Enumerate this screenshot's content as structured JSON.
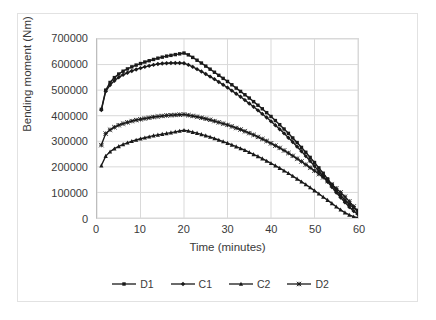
{
  "chart_data": {
    "type": "line",
    "title": "",
    "xlabel": "Time (minutes)",
    "ylabel": "Bending moment (Nm)",
    "xlim": [
      0,
      60
    ],
    "ylim": [
      0,
      700000
    ],
    "xticks": [
      0,
      10,
      20,
      30,
      40,
      50,
      60
    ],
    "yticks": [
      0,
      100000,
      200000,
      300000,
      400000,
      500000,
      600000,
      700000
    ],
    "ytick_labels": [
      "0",
      "100000",
      "200000",
      "300000",
      "400000",
      "500000",
      "600000",
      "700000"
    ],
    "xtick_labels": [
      "0",
      "10",
      "20",
      "30",
      "40",
      "50",
      "60"
    ],
    "grid": "horizontal-and-vertical",
    "legend_position": "bottom",
    "line_color": "#1a1a1a",
    "grid_color": "#d9d9d9",
    "x": [
      1,
      2,
      3,
      4,
      5,
      6,
      7,
      8,
      9,
      10,
      11,
      12,
      13,
      14,
      15,
      16,
      17,
      18,
      19,
      20,
      21,
      22,
      23,
      24,
      25,
      26,
      27,
      28,
      29,
      30,
      31,
      32,
      33,
      34,
      35,
      36,
      37,
      38,
      39,
      40,
      41,
      42,
      43,
      44,
      45,
      46,
      47,
      48,
      49,
      50,
      51,
      52,
      53,
      54,
      55,
      56,
      57,
      58,
      59,
      60
    ],
    "series": [
      {
        "name": "D1",
        "marker": "square",
        "values": [
          425000,
          500000,
          530000,
          549000,
          563000,
          574000,
          583000,
          591000,
          598000,
          604000,
          610000,
          615000,
          620000,
          625000,
          629000,
          633000,
          636000,
          639000,
          642000,
          645000,
          638000,
          628000,
          617000,
          606000,
          594000,
          582000,
          570000,
          558000,
          546000,
          534000,
          521000,
          508000,
          495000,
          482000,
          469000,
          455000,
          441000,
          427000,
          412000,
          397000,
          381000,
          365000,
          348000,
          331000,
          313000,
          295000,
          276000,
          257000,
          237000,
          217000,
          196000,
          175000,
          153000,
          131000,
          109000,
          88000,
          70000,
          54000,
          40000,
          30000
        ]
      },
      {
        "name": "C1",
        "marker": "diamond",
        "values": [
          422000,
          495000,
          520000,
          537000,
          550000,
          560000,
          568000,
          575000,
          581000,
          586000,
          591000,
          595000,
          599000,
          602000,
          604000,
          605000,
          606000,
          606000,
          606000,
          605000,
          599000,
          591000,
          582000,
          573000,
          563000,
          553000,
          543000,
          532000,
          521000,
          510000,
          498000,
          486000,
          474000,
          461000,
          448000,
          435000,
          421000,
          407000,
          393000,
          378000,
          363000,
          347000,
          331000,
          314000,
          297000,
          279000,
          261000,
          242000,
          223000,
          203000,
          183000,
          163000,
          142000,
          121000,
          100000,
          80000,
          61000,
          43000,
          27000,
          14000
        ]
      },
      {
        "name": "C2",
        "marker": "triangle",
        "values": [
          205000,
          242000,
          259000,
          271000,
          280000,
          288000,
          294000,
          300000,
          305000,
          310000,
          314000,
          318000,
          322000,
          325000,
          328000,
          331000,
          334000,
          337000,
          340000,
          343000,
          340000,
          336000,
          332000,
          327000,
          322000,
          317000,
          311000,
          305000,
          299000,
          293000,
          286000,
          279000,
          272000,
          265000,
          257000,
          249000,
          241000,
          232000,
          223000,
          214000,
          205000,
          195000,
          185000,
          175000,
          164000,
          153000,
          142000,
          131000,
          119000,
          107000,
          95000,
          82000,
          70000,
          57000,
          44000,
          32000,
          21000,
          12000,
          5000,
          1000
        ]
      },
      {
        "name": "D2",
        "marker": "star",
        "values": [
          285000,
          330000,
          345000,
          355000,
          363000,
          369000,
          374000,
          379000,
          383000,
          386000,
          389000,
          392000,
          395000,
          397000,
          399000,
          401000,
          402000,
          403000,
          404000,
          405000,
          402000,
          399000,
          396000,
          392000,
          388000,
          384000,
          379000,
          374000,
          369000,
          364000,
          358000,
          352000,
          346000,
          339000,
          332000,
          325000,
          317000,
          309000,
          301000,
          292000,
          283000,
          274000,
          264000,
          254000,
          243000,
          232000,
          221000,
          209000,
          197000,
          185000,
          172000,
          159000,
          145000,
          131000,
          116000,
          100000,
          83000,
          65000,
          45000,
          22000
        ]
      }
    ]
  },
  "legend": {
    "items": [
      {
        "label": "D1",
        "marker": "square"
      },
      {
        "label": "C1",
        "marker": "diamond"
      },
      {
        "label": "C2",
        "marker": "triangle"
      },
      {
        "label": "D2",
        "marker": "star"
      }
    ]
  }
}
